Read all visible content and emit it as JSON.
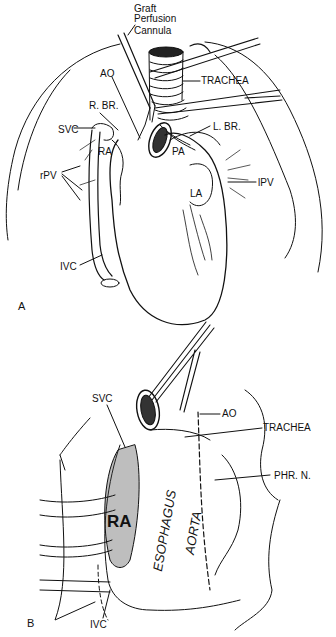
{
  "figure": {
    "panels": [
      {
        "letter": "A",
        "labels": {
          "graft_line1": "Graft",
          "graft_line2": "Perfusion",
          "graft_line3": "Cannula",
          "ao": "AO",
          "trachea": "TRACHEA",
          "r_br": "R. BR.",
          "svc": "SVC",
          "l_br": "L. BR.",
          "ra": "RA",
          "pa": "PA",
          "rpv": "rPV",
          "lpv": "lPV",
          "la": "LA",
          "ivc": "IVC"
        }
      },
      {
        "letter": "B",
        "labels": {
          "svc": "SVC",
          "ao": "AO",
          "trachea": "TRACHEA",
          "phr_n": "PHR. N.",
          "ra": "RA",
          "esophagus": "ESOPHAGUS",
          "aorta": "AORTA",
          "ivc": "IVC"
        }
      }
    ]
  }
}
